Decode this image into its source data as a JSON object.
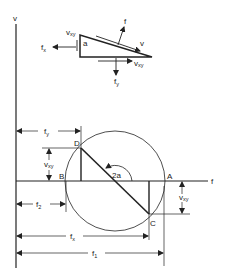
{
  "diagram": {
    "axes": {
      "vertical_label": "v",
      "horizontal_label": "f"
    },
    "element": {
      "angle_label": "a",
      "labels": {
        "f": "f",
        "v": "v",
        "vxy_left": "v",
        "vxy_left_sub": "xy",
        "vxy_bottom": "v",
        "vxy_bottom_sub": "xy",
        "fx": "f",
        "fx_sub": "x",
        "fy": "f",
        "fy_sub": "y"
      }
    },
    "circle": {
      "points": {
        "A": "A",
        "B": "B",
        "C": "C",
        "D": "D"
      },
      "angle_label": "2a"
    },
    "dimensions": {
      "fy": {
        "main": "f",
        "sub": "y"
      },
      "vxy_upper": {
        "main": "v",
        "sub": "xy"
      },
      "vxy_lower": {
        "main": "v",
        "sub": "xy"
      },
      "f2": {
        "main": "f",
        "sub": "2"
      },
      "fx": {
        "main": "f",
        "sub": "x"
      },
      "f1": {
        "main": "f",
        "sub": "1"
      }
    },
    "colors": {
      "ink": "#222222",
      "background": "#ffffff"
    }
  }
}
